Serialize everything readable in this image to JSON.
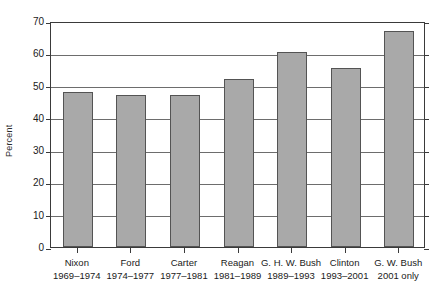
{
  "chart_data": {
    "type": "bar",
    "title": "",
    "xlabel": "",
    "ylabel": "Percent",
    "ylim": [
      0,
      70
    ],
    "ytick_step": 10,
    "yticks": [
      0,
      10,
      20,
      30,
      40,
      50,
      60,
      70
    ],
    "grid": true,
    "legend": "none",
    "bar_color": "#a9a9a9",
    "bar_border_color": "#545454",
    "categories": [
      "Nixon",
      "Ford",
      "Carter",
      "Reagan",
      "G. H. W. Bush",
      "Clinton",
      "G. W. Bush"
    ],
    "category_subtitles": [
      "1969–1974",
      "1974–1977",
      "1977–1981",
      "1981–1989",
      "1989–1993",
      "1993–2001",
      "2001 only"
    ],
    "values": [
      48,
      47,
      47,
      52,
      60.5,
      55.5,
      67
    ]
  },
  "axis": {
    "y_title": "Percent",
    "y_tick_labels": [
      "70",
      "60",
      "50",
      "40",
      "30",
      "20",
      "10",
      "0"
    ]
  }
}
